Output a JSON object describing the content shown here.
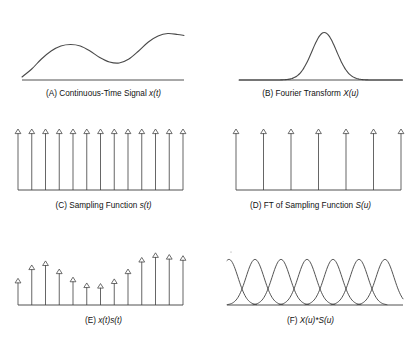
{
  "figure": {
    "stroke_color": "#4a4a4a",
    "axis_color": "#3d3d3d",
    "background": "#ffffff"
  },
  "panels": [
    {
      "id": "A",
      "caption_prefix": "(A) Continuous-Time Signal ",
      "caption_math": "x(t)",
      "type": "curve"
    },
    {
      "id": "B",
      "caption_prefix": "(B) Fourier Transform ",
      "caption_math": "X(u)",
      "type": "gaussian"
    },
    {
      "id": "C",
      "caption_prefix": "(C) Sampling Function ",
      "caption_math": "s(t)",
      "type": "impulse-train"
    },
    {
      "id": "D",
      "caption_prefix": "(D) FT of Sampling Function ",
      "caption_math": "S(u)",
      "type": "impulse-train"
    },
    {
      "id": "E",
      "caption_prefix": "(E) ",
      "caption_math": "x(t)s(t)",
      "type": "impulse-train-modulated"
    },
    {
      "id": "F",
      "caption_prefix": "(F) ",
      "caption_math": "X(u)*S(u)",
      "type": "gaussian-train"
    }
  ],
  "chart_data": [
    {
      "type": "line",
      "panel": "A",
      "title": "(A) Continuous-Time Signal x(t)",
      "xlabel": "",
      "ylabel": "",
      "grid": false,
      "legend": "none",
      "xlim": [
        0,
        100
      ],
      "ylim": [
        0,
        1
      ],
      "comment": "smooth band-limited waveform: rise, local max, dip, rise to plateau",
      "x": [
        0,
        6,
        12,
        18,
        24,
        30,
        36,
        42,
        48,
        54,
        60,
        66,
        72,
        78,
        84,
        90,
        96,
        100
      ],
      "y": [
        0.06,
        0.22,
        0.42,
        0.58,
        0.68,
        0.71,
        0.68,
        0.58,
        0.45,
        0.36,
        0.34,
        0.42,
        0.58,
        0.76,
        0.88,
        0.93,
        0.91,
        0.89
      ]
    },
    {
      "type": "line",
      "panel": "B",
      "title": "(B) Fourier Transform X(u)",
      "xlabel": "",
      "ylabel": "",
      "grid": false,
      "legend": "none",
      "xlim": [
        0,
        100
      ],
      "ylim": [
        0,
        1
      ],
      "comment": "single centered Gaussian lobe, band-limited spectrum",
      "peaks": [
        {
          "center": 52,
          "height": 0.95,
          "sigma": 7.5
        }
      ]
    },
    {
      "type": "bar",
      "panel": "C",
      "title": "(C) Sampling Function s(t)",
      "xlabel": "",
      "ylabel": "",
      "grid": false,
      "legend": "none",
      "ylim": [
        0,
        1
      ],
      "comment": "uniform impulse train, 13 equal-height impulses",
      "categories": [
        1,
        2,
        3,
        4,
        5,
        6,
        7,
        8,
        9,
        10,
        11,
        12,
        13
      ],
      "values": [
        1,
        1,
        1,
        1,
        1,
        1,
        1,
        1,
        1,
        1,
        1,
        1,
        1
      ],
      "impulse_count": 13,
      "impulse_spacing_px": 13.5
    },
    {
      "type": "bar",
      "panel": "D",
      "title": "(D) FT of Sampling Function S(u)",
      "xlabel": "",
      "ylabel": "",
      "grid": false,
      "legend": "none",
      "ylim": [
        0,
        1
      ],
      "comment": "impulse train with reciprocal (wider) spacing, 7 impulses",
      "categories": [
        1,
        2,
        3,
        4,
        5,
        6,
        7
      ],
      "values": [
        1,
        1,
        1,
        1,
        1,
        1,
        1
      ],
      "impulse_count": 7,
      "impulse_spacing_px": 27
    },
    {
      "type": "bar",
      "panel": "E",
      "title": "(E) x(t)s(t)",
      "xlabel": "",
      "ylabel": "",
      "grid": false,
      "legend": "none",
      "ylim": [
        0,
        1
      ],
      "comment": "sampled signal: impulse heights follow the envelope of panel A",
      "categories": [
        1,
        2,
        3,
        4,
        5,
        6,
        7,
        8,
        9,
        10,
        11,
        12,
        13
      ],
      "values": [
        0.46,
        0.69,
        0.76,
        0.62,
        0.48,
        0.38,
        0.37,
        0.45,
        0.62,
        0.82,
        0.9,
        0.87,
        0.85
      ]
    },
    {
      "type": "line",
      "panel": "F",
      "title": "(F) X(u)*S(u)",
      "xlabel": "",
      "ylabel": "",
      "grid": false,
      "legend": "none",
      "ylim": [
        0,
        1
      ],
      "comment": "periodic replicas of X(u) convolved with S(u); adjacent lobes overlap (aliasing)",
      "peak_count": 7,
      "peaks": [
        {
          "center": 2,
          "height": 0.95,
          "sigma": 9
        },
        {
          "center": 28,
          "height": 0.95,
          "sigma": 9
        },
        {
          "center": 54,
          "height": 0.95,
          "sigma": 9
        },
        {
          "center": 80,
          "height": 0.95,
          "sigma": 9
        },
        {
          "center": 106,
          "height": 0.95,
          "sigma": 9
        },
        {
          "center": 132,
          "height": 0.95,
          "sigma": 9
        },
        {
          "center": 158,
          "height": 0.95,
          "sigma": 9
        }
      ]
    }
  ]
}
